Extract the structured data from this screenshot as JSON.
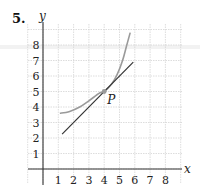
{
  "problem": {
    "number": "5."
  },
  "colors": {
    "curve": "#9a9a9a",
    "tangent": "#333333",
    "grid": "#d4d4d4",
    "axis": "#333333",
    "point": "#9a9a9a"
  },
  "chart_data": {
    "type": "line",
    "title": "",
    "xlabel": "x",
    "ylabel": "y",
    "xlim": [
      0,
      9
    ],
    "ylim": [
      -0.5,
      9.3
    ],
    "grid": true,
    "x_ticks": [
      "1",
      "2",
      "3",
      "4",
      "5",
      "6",
      "7",
      "8"
    ],
    "y_ticks": [
      "1",
      "2",
      "3",
      "4",
      "5",
      "6",
      "7",
      "8"
    ],
    "series": [
      {
        "name": "curve",
        "style": "smooth gray curve",
        "x": [
          1.1,
          1.7,
          2.4,
          3.0,
          3.7,
          4.0,
          4.5,
          4.85,
          5.2,
          5.45,
          5.7
        ],
        "y": [
          3.6,
          3.7,
          4.0,
          4.4,
          4.9,
          5.0,
          5.5,
          6.1,
          7.0,
          7.9,
          8.8
        ]
      },
      {
        "name": "tangent line at P",
        "style": "dark straight line",
        "x": [
          1.25,
          5.9
        ],
        "y": [
          2.25,
          6.9
        ],
        "slope": 1
      }
    ],
    "annotations": [
      {
        "label": "P",
        "x": 4,
        "y": 5,
        "marker": "dot"
      }
    ]
  },
  "labels": {
    "x_axis": "x",
    "y_axis": "y",
    "point": "P",
    "xticks": [
      "1",
      "2",
      "3",
      "4",
      "5",
      "6",
      "7",
      "8"
    ],
    "yticks": [
      "1",
      "2",
      "3",
      "4",
      "5",
      "6",
      "7",
      "8"
    ]
  }
}
